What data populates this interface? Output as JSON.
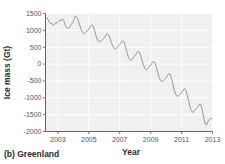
{
  "figure": {
    "caption": "(b) Greenland",
    "background_color": "#ffffff"
  },
  "chart_data": {
    "type": "line",
    "title": "",
    "subtitle": "",
    "caption": "(b) Greenland",
    "xlabel": "Year",
    "ylabel": "Ice mass (Gt)",
    "xlim": [
      2002.2,
      2013.0
    ],
    "ylim": [
      -2000,
      1500
    ],
    "xticks": [
      2003,
      2005,
      2007,
      2009,
      2011,
      2013
    ],
    "xtick_labels": [
      "2003",
      "2005",
      "2007",
      "2009",
      "2011",
      "2013"
    ],
    "yticks": [
      1500,
      1000,
      500,
      0,
      -500,
      -1000,
      -1500,
      -2000
    ],
    "ytick_labels": [
      "1500",
      "1000",
      "500",
      "0",
      "-500",
      "-1000",
      "-1500",
      "-2000"
    ],
    "grid": true,
    "grid_color": "#ffffff",
    "plot_background": "#f0f0f0",
    "legend": null,
    "legend_position": "none",
    "series": [
      {
        "name": "Greenland ice mass anomaly",
        "color": "#8c8c8c",
        "line_width": 0.9,
        "x": [
          2002.29,
          2002.46,
          2002.62,
          2002.71,
          2002.79,
          2002.87,
          2002.96,
          2003.04,
          2003.12,
          2003.21,
          2003.29,
          2003.37,
          2003.46,
          2003.54,
          2003.62,
          2003.71,
          2003.79,
          2003.87,
          2003.96,
          2004.04,
          2004.12,
          2004.21,
          2004.29,
          2004.37,
          2004.46,
          2004.54,
          2004.62,
          2004.71,
          2004.79,
          2004.87,
          2004.96,
          2005.04,
          2005.12,
          2005.21,
          2005.29,
          2005.37,
          2005.46,
          2005.54,
          2005.62,
          2005.71,
          2005.79,
          2005.87,
          2005.96,
          2006.04,
          2006.12,
          2006.21,
          2006.29,
          2006.37,
          2006.46,
          2006.54,
          2006.62,
          2006.71,
          2006.79,
          2006.87,
          2006.96,
          2007.04,
          2007.12,
          2007.21,
          2007.29,
          2007.37,
          2007.46,
          2007.54,
          2007.62,
          2007.71,
          2007.79,
          2007.87,
          2007.96,
          2008.04,
          2008.12,
          2008.21,
          2008.29,
          2008.37,
          2008.46,
          2008.54,
          2008.62,
          2008.71,
          2008.79,
          2008.87,
          2008.96,
          2009.04,
          2009.12,
          2009.21,
          2009.29,
          2009.37,
          2009.46,
          2009.54,
          2009.62,
          2009.71,
          2009.79,
          2009.87,
          2009.96,
          2010.04,
          2010.12,
          2010.21,
          2010.29,
          2010.37,
          2010.46,
          2010.54,
          2010.62,
          2010.71,
          2010.79,
          2010.87,
          2010.96,
          2011.04,
          2011.12,
          2011.21,
          2011.29,
          2011.37,
          2011.46,
          2011.54,
          2011.62,
          2011.71,
          2011.79,
          2011.87,
          2011.96,
          2012.04,
          2012.12,
          2012.21,
          2012.29,
          2012.37,
          2012.46,
          2012.54,
          2012.62,
          2012.71,
          2012.79,
          2012.87,
          2012.96
        ],
        "y": [
          1380,
          1230,
          1200,
          1150,
          1180,
          1230,
          1220,
          1260,
          1300,
          1290,
          1340,
          1300,
          1180,
          1090,
          1060,
          1070,
          1110,
          1180,
          1230,
          1320,
          1430,
          1400,
          1330,
          1220,
          1090,
          980,
          930,
          900,
          930,
          990,
          1010,
          1060,
          1130,
          1170,
          1120,
          1000,
          850,
          740,
          680,
          660,
          690,
          720,
          760,
          800,
          870,
          900,
          860,
          760,
          640,
          540,
          480,
          450,
          470,
          520,
          560,
          600,
          660,
          690,
          640,
          520,
          370,
          230,
          150,
          110,
          130,
          180,
          230,
          280,
          350,
          380,
          330,
          220,
          80,
          -40,
          -120,
          -170,
          -150,
          -100,
          -60,
          -10,
          50,
          80,
          30,
          -90,
          -240,
          -380,
          -470,
          -520,
          -500,
          -460,
          -420,
          -380,
          -310,
          -280,
          -340,
          -470,
          -640,
          -790,
          -900,
          -960,
          -940,
          -900,
          -860,
          -820,
          -760,
          -730,
          -790,
          -930,
          -1100,
          -1260,
          -1370,
          -1430,
          -1410,
          -1360,
          -1320,
          -1280,
          -1210,
          -1180,
          -1260,
          -1440,
          -1650,
          -1790,
          -1810,
          -1700,
          -1640,
          -1620,
          -1610
        ]
      }
    ]
  },
  "axes": {
    "y_axis_label": "Ice mass (Gt)",
    "x_axis_label": "Year"
  }
}
